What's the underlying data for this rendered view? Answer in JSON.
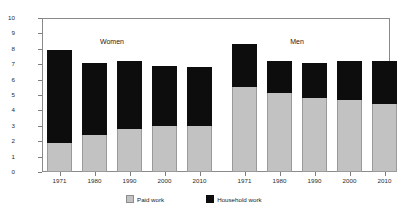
{
  "chart_data": {
    "type": "bar",
    "title": "",
    "xlabel": "",
    "ylabel": "Hours per day",
    "ylim": [
      0,
      10
    ],
    "ytick_labels": [
      "10",
      "9",
      "8",
      "7",
      "6",
      "5",
      "4",
      "3",
      "2",
      "1",
      "0"
    ],
    "ytick_values": [
      10,
      9,
      8,
      7,
      6,
      5,
      4,
      3,
      2,
      1,
      0
    ],
    "grid": false,
    "stacked": true,
    "legend_position": "bottom",
    "categories": [
      "1971",
      "1980",
      "1990",
      "2000",
      "2010"
    ],
    "groups": [
      {
        "name": "Women",
        "categories": [
          "1971",
          "1980",
          "1990",
          "2000",
          "2010"
        ],
        "series": [
          {
            "name": "Paid work",
            "values": [
              1.9,
              2.4,
              2.8,
              3.0,
              3.0
            ]
          },
          {
            "name": "Household work",
            "values": [
              6.0,
              4.7,
              4.4,
              3.9,
              3.8
            ]
          }
        ],
        "totals": [
          7.9,
          7.1,
          7.2,
          6.9,
          6.8
        ]
      },
      {
        "name": "Men",
        "categories": [
          "1971",
          "1980",
          "1990",
          "2000",
          "2010"
        ],
        "series": [
          {
            "name": "Paid work",
            "values": [
              5.5,
              5.1,
              4.8,
              4.7,
              4.4
            ]
          },
          {
            "name": "Household work",
            "values": [
              2.8,
              2.1,
              2.3,
              2.5,
              2.8
            ]
          }
        ],
        "totals": [
          8.3,
          7.2,
          7.1,
          7.2,
          7.2
        ]
      }
    ],
    "legend": [
      {
        "label": "Paid work",
        "color": "#c2c2c2"
      },
      {
        "label": "Household work",
        "color": "#0d0d0d"
      }
    ]
  },
  "colors": {
    "paid_work": "#c2c2c2",
    "household_work": "#0d0d0d",
    "axis": "#8a8a8a",
    "background": "#ffffff"
  }
}
